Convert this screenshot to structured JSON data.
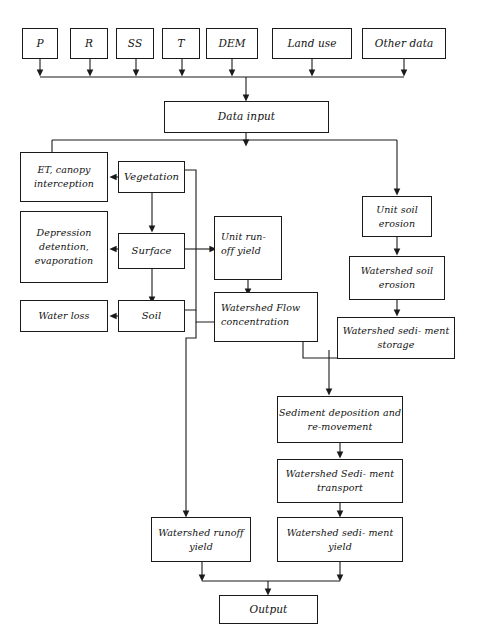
{
  "figure": {
    "type": "flowchart",
    "caption": "",
    "colors": {
      "stroke": "#1a1a1a",
      "fill": "#ffffff",
      "text": "#111111"
    }
  },
  "nodes": {
    "inputs": [
      {
        "id": "p",
        "label": "P"
      },
      {
        "id": "r",
        "label": "R"
      },
      {
        "id": "ss",
        "label": "SS"
      },
      {
        "id": "t",
        "label": "T"
      },
      {
        "id": "dem",
        "label": "DEM"
      },
      {
        "id": "land_use",
        "label": "Land use"
      },
      {
        "id": "other_data",
        "label": "Other data"
      }
    ],
    "data_input": {
      "label": "Data input"
    },
    "hydrology": {
      "vegetation": {
        "label": "Vegetation"
      },
      "surface": {
        "label": "Surface"
      },
      "soil": {
        "label": "Soil"
      }
    },
    "losses": {
      "et_canopy": {
        "line1": "ET,  canopy",
        "line2": "interception"
      },
      "depression": {
        "line1": "Depression",
        "line2": "detention,",
        "line3": "evaporation"
      },
      "water_loss": {
        "label": "Water loss"
      }
    },
    "runoff": {
      "unit_runoff_yield": {
        "line1": "Unit    run-",
        "line2": "off yield"
      },
      "flow_concentration": {
        "line1": "Watershed    Flow",
        "line2": "concentration"
      },
      "watershed_runoff_yield": {
        "line1": "Watershed",
        "line2": "runoff yield"
      }
    },
    "erosion": {
      "unit_soil_erosion": {
        "line1": "Unit soil",
        "line2": "erosion"
      },
      "watershed_soil_erosion": {
        "line1": "Watershed",
        "line2": "soil erosion"
      },
      "watershed_sediment_storage": {
        "line1": "Watershed sedi-",
        "line2": "ment storage"
      },
      "sediment_deposition": {
        "line1": "Sediment deposition",
        "line2": "and re-movement"
      },
      "watershed_sediment_transport": {
        "line1": "Watershed Sedi-",
        "line2": "ment transport"
      },
      "watershed_sediment_yield": {
        "line1": "Watershed sedi-",
        "line2": "ment yield"
      }
    },
    "output": {
      "label": "Output"
    }
  }
}
